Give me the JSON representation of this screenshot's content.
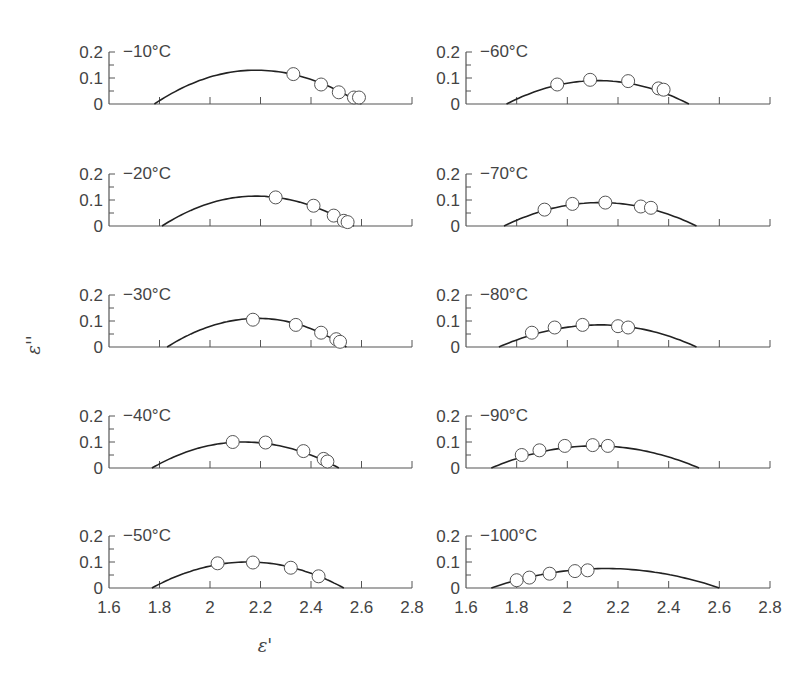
{
  "chart_data": {
    "type": "scatter",
    "title": "",
    "xlabel": "ε'",
    "ylabel": "ε''",
    "xlim": [
      1.6,
      2.8
    ],
    "ylim": [
      0,
      0.2
    ],
    "xticks": [
      "1.6",
      "1.8",
      "2",
      "2.2",
      "2.4",
      "2.6",
      "2.8"
    ],
    "yticks": [
      "0",
      "0.1",
      "0.2"
    ],
    "grid": false,
    "layout": {
      "rows": 5,
      "cols": 2
    },
    "panels": [
      {
        "label": "−10°C",
        "col": 0,
        "row": 0,
        "arc": {
          "x_start": 1.78,
          "x_end": 2.6,
          "peak_x": 2.18,
          "peak_y": 0.13
        },
        "points": [
          [
            2.33,
            0.115
          ],
          [
            2.44,
            0.075
          ],
          [
            2.51,
            0.045
          ],
          [
            2.57,
            0.025
          ],
          [
            2.59,
            0.025
          ]
        ]
      },
      {
        "label": "−20°C",
        "col": 0,
        "row": 1,
        "arc": {
          "x_start": 1.81,
          "x_end": 2.57,
          "peak_x": 2.18,
          "peak_y": 0.115
        },
        "points": [
          [
            2.26,
            0.11
          ],
          [
            2.41,
            0.078
          ],
          [
            2.49,
            0.04
          ],
          [
            2.53,
            0.02
          ],
          [
            2.545,
            0.015
          ]
        ]
      },
      {
        "label": "−30°C",
        "col": 0,
        "row": 2,
        "arc": {
          "x_start": 1.83,
          "x_end": 2.54,
          "peak_x": 2.19,
          "peak_y": 0.11
        },
        "points": [
          [
            2.17,
            0.105
          ],
          [
            2.34,
            0.085
          ],
          [
            2.44,
            0.055
          ],
          [
            2.5,
            0.03
          ],
          [
            2.515,
            0.02
          ]
        ]
      },
      {
        "label": "−40°C",
        "col": 0,
        "row": 3,
        "arc": {
          "x_start": 1.77,
          "x_end": 2.51,
          "peak_x": 2.13,
          "peak_y": 0.1
        },
        "points": [
          [
            2.09,
            0.1
          ],
          [
            2.22,
            0.098
          ],
          [
            2.37,
            0.065
          ],
          [
            2.45,
            0.035
          ],
          [
            2.465,
            0.025
          ]
        ]
      },
      {
        "label": "−50°C",
        "col": 0,
        "row": 4,
        "arc": {
          "x_start": 1.77,
          "x_end": 2.53,
          "peak_x": 2.15,
          "peak_y": 0.1
        },
        "points": [
          [
            2.03,
            0.095
          ],
          [
            2.17,
            0.098
          ],
          [
            2.32,
            0.078
          ],
          [
            2.43,
            0.045
          ]
        ]
      },
      {
        "label": "−60°C",
        "col": 1,
        "row": 0,
        "arc": {
          "x_start": 1.76,
          "x_end": 2.48,
          "peak_x": 2.12,
          "peak_y": 0.09
        },
        "points": [
          [
            1.96,
            0.075
          ],
          [
            2.09,
            0.093
          ],
          [
            2.24,
            0.088
          ],
          [
            2.36,
            0.06
          ],
          [
            2.38,
            0.055
          ]
        ]
      },
      {
        "label": "−70°C",
        "col": 1,
        "row": 1,
        "arc": {
          "x_start": 1.75,
          "x_end": 2.51,
          "peak_x": 2.13,
          "peak_y": 0.09
        },
        "points": [
          [
            1.91,
            0.063
          ],
          [
            2.02,
            0.085
          ],
          [
            2.15,
            0.09
          ],
          [
            2.29,
            0.075
          ],
          [
            2.33,
            0.07
          ]
        ]
      },
      {
        "label": "−80°C",
        "col": 1,
        "row": 2,
        "arc": {
          "x_start": 1.73,
          "x_end": 2.51,
          "peak_x": 2.13,
          "peak_y": 0.085
        },
        "points": [
          [
            1.86,
            0.055
          ],
          [
            1.95,
            0.075
          ],
          [
            2.06,
            0.085
          ],
          [
            2.2,
            0.08
          ],
          [
            2.24,
            0.075
          ]
        ]
      },
      {
        "label": "−90°C",
        "col": 1,
        "row": 3,
        "arc": {
          "x_start": 1.7,
          "x_end": 2.52,
          "peak_x": 2.11,
          "peak_y": 0.085
        },
        "points": [
          [
            1.82,
            0.05
          ],
          [
            1.89,
            0.068
          ],
          [
            1.99,
            0.085
          ],
          [
            2.1,
            0.088
          ],
          [
            2.16,
            0.085
          ]
        ]
      },
      {
        "label": "−100°C",
        "col": 1,
        "row": 4,
        "arc": {
          "x_start": 1.7,
          "x_end": 2.6,
          "peak_x": 2.15,
          "peak_y": 0.075
        },
        "points": [
          [
            1.8,
            0.03
          ],
          [
            1.85,
            0.04
          ],
          [
            1.93,
            0.055
          ],
          [
            2.03,
            0.065
          ],
          [
            2.08,
            0.068
          ]
        ]
      }
    ]
  },
  "style": {
    "line_color": "#222222",
    "axis_color": "#555555",
    "marker_fill": "#ffffff",
    "marker_stroke": "#555555"
  }
}
